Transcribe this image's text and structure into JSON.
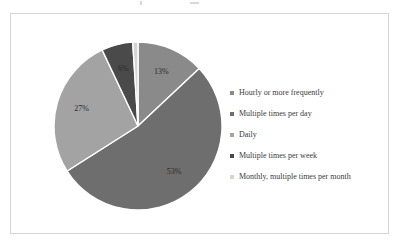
{
  "chart_data": {
    "type": "pie",
    "title": "",
    "subtitle": "",
    "legend_position": "right",
    "grid": false,
    "categories": [
      "Hourly or more frequently",
      "Multiple times per day",
      "Daily",
      "Multiple times per week",
      "Monthly, multiple times per month"
    ],
    "values": [
      13,
      53,
      27,
      6,
      1
    ],
    "data_labels": [
      "13%",
      "53%",
      "27%",
      "6%",
      "1%"
    ],
    "colors": [
      "#8a8a8a",
      "#6e6e6e",
      "#a3a3a3",
      "#4a4a4a",
      "#d4d4d4"
    ],
    "slices": [
      {
        "label": "Hourly or more frequently",
        "value": 13,
        "data_label": "13%",
        "color": "#8a8a8a"
      },
      {
        "label": "Multiple times per day",
        "value": 53,
        "data_label": "53%",
        "color": "#6e6e6e"
      },
      {
        "label": "Daily",
        "value": 27,
        "data_label": "27%",
        "color": "#a3a3a3"
      },
      {
        "label": "Multiple times per week",
        "value": 6,
        "data_label": "6%",
        "color": "#4a4a4a"
      },
      {
        "label": "Monthly, multiple times per month",
        "value": 1,
        "data_label": "1%",
        "color": "#d4d4d4"
      }
    ]
  },
  "legend": {
    "items": [
      {
        "label": "Hourly or more frequently",
        "color": "#8a8a8a"
      },
      {
        "label": "Multiple times per day",
        "color": "#6e6e6e"
      },
      {
        "label": "Daily",
        "color": "#a3a3a3"
      },
      {
        "label": "Multiple times per week",
        "color": "#4a4a4a"
      },
      {
        "label": "Monthly, multiple times per month",
        "color": "#d4d4d4"
      }
    ]
  },
  "style": {
    "frame_border_color": "#d5d5d5",
    "background": "#ffffff",
    "slice_separator_color": "#ffffff",
    "label_color": "#2b2b2b"
  }
}
